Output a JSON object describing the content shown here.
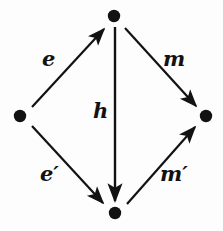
{
  "diagram": {
    "kind": "commutative-diagram",
    "shape": "diamond",
    "width": 223,
    "height": 231,
    "background_color": "#fdfdfd",
    "ink_color": "#121212",
    "nodes": [
      {
        "id": "top",
        "name": "top-vertex",
        "x": 114,
        "y": 16,
        "radius": 6,
        "label": ""
      },
      {
        "id": "left",
        "name": "left-vertex",
        "x": 20,
        "y": 116,
        "radius": 6,
        "label": ""
      },
      {
        "id": "right",
        "name": "right-vertex",
        "x": 206,
        "y": 116,
        "radius": 6,
        "label": ""
      },
      {
        "id": "bottom",
        "name": "bottom-vertex",
        "x": 115,
        "y": 213,
        "radius": 6,
        "label": ""
      }
    ],
    "edges": [
      {
        "id": "e",
        "label": "e",
        "from": "left",
        "to": "top",
        "direction": "up-right",
        "x1": 32,
        "y1": 107,
        "x2": 104,
        "y2": 29
      },
      {
        "id": "m",
        "label": "m",
        "from": "top",
        "to": "right",
        "direction": "down-right",
        "x1": 125,
        "y1": 28,
        "x2": 196,
        "y2": 106
      },
      {
        "id": "h",
        "label": "h",
        "from": "top",
        "to": "bottom",
        "direction": "down",
        "x1": 115,
        "y1": 27,
        "x2": 115,
        "y2": 201
      },
      {
        "id": "ep",
        "label": "e′",
        "from": "left",
        "to": "bottom",
        "direction": "down-right",
        "x1": 32,
        "y1": 126,
        "x2": 103,
        "y2": 203
      },
      {
        "id": "mp",
        "label": "m′",
        "from": "bottom",
        "to": "right",
        "direction": "up-right",
        "x1": 127,
        "y1": 204,
        "x2": 195,
        "y2": 127
      }
    ]
  }
}
